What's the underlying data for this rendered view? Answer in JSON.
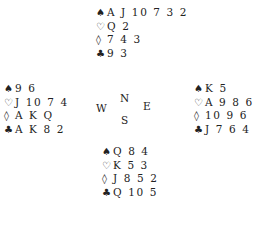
{
  "hands": {
    "north": {
      "spades": "A J 10 7 3 2",
      "hearts": "Q 2",
      "diamonds": "7 4 3",
      "clubs": "9 3"
    },
    "west": {
      "spades": "9 6",
      "hearts": "J 10 7 4",
      "diamonds": "A K Q",
      "clubs": "A K 8 2"
    },
    "east": {
      "spades": "K 5",
      "hearts": "A 9 8 6",
      "diamonds": "10 9 6",
      "clubs": "J 7 6 4"
    },
    "south": {
      "spades": "Q 8 4",
      "hearts": "K 5 3",
      "diamonds": "J 8 5 2",
      "clubs": "Q 10 5"
    }
  },
  "suit_symbols": {
    "spades": "♠",
    "hearts": "♡",
    "diamonds": "◊",
    "clubs": "♣"
  },
  "compass": {
    "north": "N",
    "south": "S",
    "east": "E",
    "west": "W"
  }
}
